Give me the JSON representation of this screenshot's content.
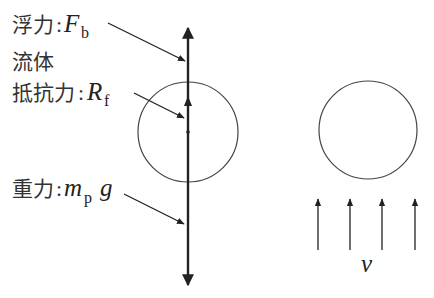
{
  "labels": {
    "buoyancy": {
      "text": "浮力",
      "colon": ":",
      "symbol": "F",
      "subscript": "b"
    },
    "drag_line1": {
      "text": "流体"
    },
    "drag_line2": {
      "text": "抵抗力",
      "colon": ":",
      "symbol": "R",
      "subscript": "f"
    },
    "gravity": {
      "text": "重力",
      "colon": ":",
      "symbol": "m",
      "subscript": "p",
      "suffix": "g"
    },
    "velocity": {
      "symbol": "v"
    }
  },
  "figure": {
    "left": {
      "circle": {
        "cx": 188,
        "cy": 132,
        "r": 50
      },
      "force_axis": {
        "x": 188,
        "top_y": 26,
        "bottom_y": 287
      }
    },
    "right": {
      "circle": {
        "cx": 368,
        "cy": 130,
        "r": 49
      },
      "flow_arrows_x": [
        318,
        350,
        382,
        415
      ],
      "flow_arrow_tip_y": 198,
      "flow_arrow_base_y": 250
    },
    "colors": {
      "line": "#222222",
      "circle": "#444444"
    }
  }
}
